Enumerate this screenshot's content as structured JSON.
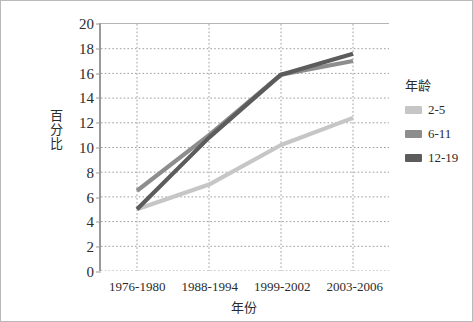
{
  "chart_data": {
    "type": "line",
    "title": "",
    "xlabel": "年份",
    "ylabel": "百分比",
    "categories": [
      "1976-1980",
      "1988-1994",
      "1999-2002",
      "2003-2006"
    ],
    "ylim": [
      0,
      20
    ],
    "yticks": [
      0,
      2,
      4,
      6,
      8,
      10,
      12,
      14,
      16,
      18,
      20
    ],
    "grid": true,
    "grid_style": "dotted",
    "legend_title": "年龄",
    "legend_position": "right",
    "series": [
      {
        "name": "2-5",
        "values": [
          5.0,
          7.0,
          10.2,
          12.4
        ],
        "color": "#c6c6c6"
      },
      {
        "name": "6-11",
        "values": [
          6.5,
          11.0,
          15.9,
          17.0
        ],
        "color": "#8d8d8d"
      },
      {
        "name": "12-19",
        "values": [
          5.0,
          10.8,
          15.9,
          17.6
        ],
        "color": "#5c5c5c"
      }
    ]
  },
  "axis": {
    "y_tick_labels": [
      "0",
      "2",
      "4",
      "6",
      "8",
      "10",
      "12",
      "14",
      "16",
      "18",
      "20"
    ],
    "x_tick_labels": [
      "1976-1980",
      "1988-1994",
      "1999-2002",
      "2003-2006"
    ],
    "y_title": "百分比",
    "x_title": "年份"
  },
  "legend": {
    "title": "年龄",
    "items": [
      {
        "label": "2-5",
        "color": "#c6c6c6"
      },
      {
        "label": "6-11",
        "color": "#8d8d8d"
      },
      {
        "label": "12-19",
        "color": "#5c5c5c"
      }
    ]
  }
}
